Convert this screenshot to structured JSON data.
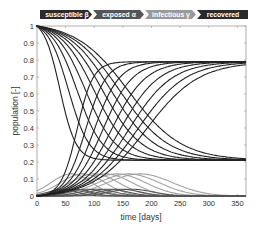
{
  "header": {
    "stages": [
      {
        "label": "susceptible",
        "symbol": "β",
        "color": "#2b2b2b"
      },
      {
        "label": "exposed",
        "symbol": "α",
        "color": "#555555"
      },
      {
        "label": "infectious",
        "symbol": "γ",
        "color": "#9a9a9a"
      },
      {
        "label": "recovered",
        "symbol": "",
        "color": "#2b2b2b"
      }
    ]
  },
  "chart_data": {
    "type": "line",
    "title": "",
    "xlabel": "time [days]",
    "ylabel": "population [-]",
    "xlim": [
      0,
      365
    ],
    "ylim": [
      0,
      1
    ],
    "xticks": [
      0,
      50,
      100,
      150,
      200,
      250,
      300,
      350
    ],
    "yticks": [
      0,
      0.1,
      0.2,
      0.3,
      0.4,
      0.5,
      0.6,
      0.7,
      0.8,
      0.9,
      1
    ],
    "grid": false,
    "legend": "stage bar above plot",
    "series_groups": [
      {
        "name": "susceptible",
        "color": "#222222",
        "description": "decreasing from 1 to ~0.21, onset shifted across runs",
        "start": 1.0,
        "end": 0.21,
        "midpoints_days": [
          40,
          55,
          70,
          85,
          100,
          115,
          130,
          145,
          160
        ]
      },
      {
        "name": "recovered",
        "color": "#222222",
        "description": "increasing from 0 to ~0.79",
        "start": 0.0,
        "end": 0.79,
        "midpoints_days": [
          70,
          85,
          100,
          115,
          130,
          145,
          160,
          175,
          190
        ]
      },
      {
        "name": "exposed",
        "color": "#555555",
        "description": "small humps, peak ~0.03-0.05",
        "peak": 0.04
      },
      {
        "name": "infectious",
        "color": "#a0a0a0",
        "description": "humps peaking ~0.13, peak days shifting",
        "peak": 0.13,
        "peak_days": [
          60,
          80,
          100,
          120,
          140,
          160,
          180
        ]
      }
    ]
  }
}
